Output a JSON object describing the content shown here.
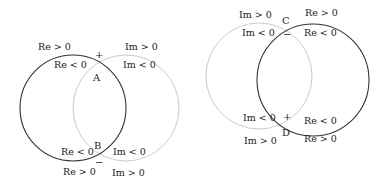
{
  "colors": {
    "dark_circle": "#333333",
    "light_circle": "#cccccc",
    "text": "#222222"
  },
  "left_diagram": {
    "points": {
      "top": "A",
      "bottom": "B"
    },
    "signs": {
      "top": "+",
      "bottom": "−"
    },
    "labels": {
      "top_outer_left": "Re > 0",
      "top_inner_left": "Re < 0",
      "top_outer_right": "Im > 0",
      "top_inner_right": "Im < 0",
      "bottom_inner_left": "Re < 0",
      "bottom_outer_left": "Re > 0",
      "bottom_inner_right": "Im < 0",
      "bottom_outer_right": "Im > 0"
    }
  },
  "right_diagram": {
    "points": {
      "top": "C",
      "bottom": "D"
    },
    "signs": {
      "top": "−",
      "bottom": "+"
    },
    "labels": {
      "top_outer_left": "Im > 0",
      "top_inner_left": "Im < 0",
      "top_outer_right": "Re > 0",
      "top_inner_right": "Re < 0",
      "bottom_inner_left": "Im < 0",
      "bottom_outer_left": "Im > 0",
      "bottom_inner_right": "Re < 0",
      "bottom_outer_right": "Re > 0"
    }
  }
}
